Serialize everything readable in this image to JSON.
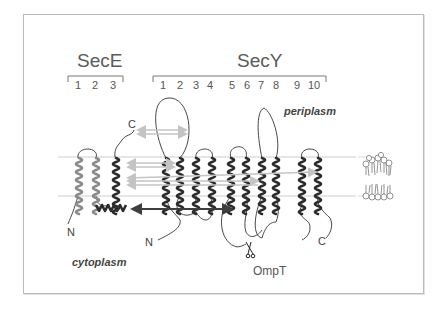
{
  "diagram": {
    "type": "membrane-topology",
    "proteins": [
      {
        "name": "SecE",
        "helix_labels": [
          "1",
          "2",
          "3"
        ]
      },
      {
        "name": "SecY",
        "helix_labels": [
          "1",
          "2",
          "3",
          "4",
          "5",
          "6",
          "7",
          "8",
          "9",
          "10"
        ]
      }
    ],
    "regions": {
      "periplasm": "periplasm",
      "cytoplasm": "cytoplasm"
    },
    "termini": {
      "secE_N": "N",
      "secE_C": "C",
      "secY_N": "N",
      "secY_C": "C"
    },
    "protease": {
      "label": "OmpT",
      "icon": "scissors-icon"
    },
    "colors": {
      "secE_tm12": "#8a8a8a",
      "helix_dark": "#2b2b2b",
      "interaction_arrow_light": "#bdbdbd",
      "interaction_arrow_dark": "#444444",
      "membrane_line": "#c8c8c8",
      "frame": "#b9b9b9"
    },
    "legend_icon": "lipid-bilayer-icon"
  }
}
